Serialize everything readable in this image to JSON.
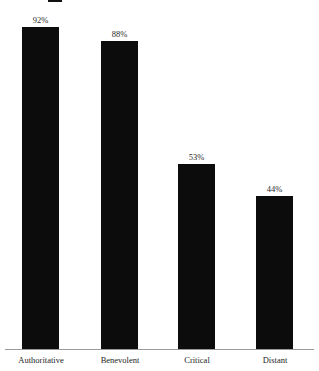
{
  "legend": {
    "swatch_color": "#111111",
    "label": "",
    "tail_text": ""
  },
  "axis": {
    "baseline_color": "#9a9a9a"
  },
  "chart_data": {
    "type": "bar",
    "title": "",
    "subtitle": "",
    "xlabel": "",
    "ylabel": "",
    "ylim": [
      0,
      100
    ],
    "grid": false,
    "legend_position": "top",
    "bar_color": "#0c0c0c",
    "categories": [
      "Authoritative",
      "Benevolent",
      "Critical",
      "Distant"
    ],
    "values": [
      92,
      88,
      53,
      44
    ],
    "value_labels": [
      "92%",
      "88%",
      "53%",
      "44%"
    ],
    "series": [
      {
        "name": "",
        "values": [
          92,
          88,
          53,
          44
        ]
      }
    ]
  }
}
